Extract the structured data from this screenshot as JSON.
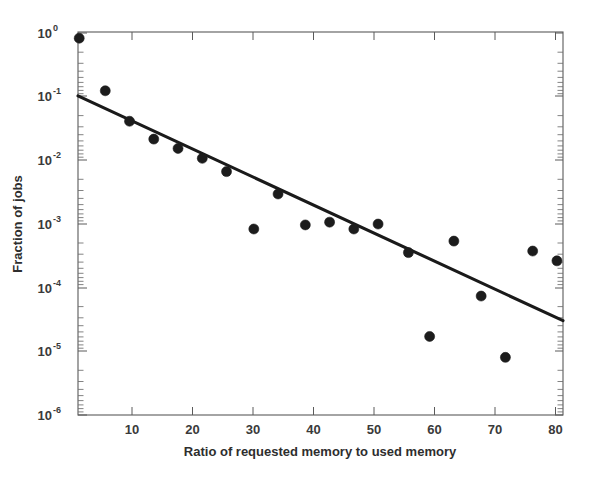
{
  "figure": {
    "background_color": "#ffffff",
    "axis_color": "#5a5a5a",
    "marker_color": "#1c1c1c",
    "line_color": "#1a1a1a"
  },
  "chart_data": {
    "type": "scatter",
    "title": "",
    "subtitle": "",
    "xlabel": "Ratio of requested memory to used memory",
    "ylabel": "Fraction of jobs",
    "xscale": "linear",
    "yscale": "log",
    "xlim": [
      1,
      81
    ],
    "ylim": [
      1e-06,
      1
    ],
    "grid": false,
    "legend": null,
    "legend_position": "none",
    "xticks": [
      10,
      20,
      30,
      40,
      50,
      60,
      70,
      80
    ],
    "xtick_labels": [
      "10",
      "20",
      "30",
      "40",
      "50",
      "60",
      "70",
      "80"
    ],
    "yticks": [
      1,
      0.1,
      0.01,
      0.001,
      0.0001,
      1e-05,
      1e-06
    ],
    "ytick_labels": [
      "10^0",
      "10^-1",
      "10^-2",
      "10^-3",
      "10^-4",
      "10^-5",
      "10^-6"
    ],
    "ytick_mantissa": [
      "10",
      "10",
      "10",
      "10",
      "10",
      "10",
      "10"
    ],
    "ytick_exponents": [
      "0",
      "-1",
      "-2",
      "-3",
      "-4",
      "-5",
      "-6"
    ],
    "series": [
      {
        "name": "Measured fraction of jobs",
        "type": "scatter",
        "marker": "filled-circle",
        "marker_size": 5,
        "color": "#1c1c1c",
        "x": [
          1.2,
          5.5,
          9.5,
          13.5,
          17.5,
          21.5,
          25.5,
          30.0,
          34.0,
          38.5,
          42.5,
          46.5,
          50.5,
          55.5,
          59.0,
          63.0,
          67.5,
          71.5,
          76.0,
          80.0
        ],
        "y": [
          0.8,
          0.12,
          0.04,
          0.021,
          0.015,
          0.0105,
          0.0065,
          0.00082,
          0.0029,
          0.00095,
          0.00105,
          0.00082,
          0.00098,
          0.00035,
          1.7e-05,
          0.00053,
          7.3e-05,
          8e-06,
          0.00037,
          0.00026
        ]
      },
      {
        "name": "Exponential fit",
        "type": "line",
        "color": "#1a1a1a",
        "linewidth": 3,
        "x": [
          1,
          81
        ],
        "y": [
          0.1,
          3e-05
        ]
      }
    ]
  }
}
